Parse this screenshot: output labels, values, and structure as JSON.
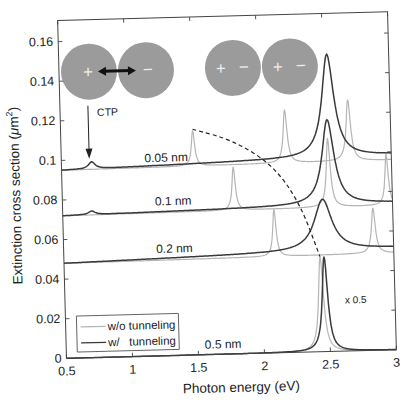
{
  "chart_data": {
    "type": "line",
    "title": "",
    "xlabel": "Photon energy (eV)",
    "ylabel": "Extinction cross section (μm²)",
    "ylabel_parts": {
      "main": "Extinction cross section (",
      "mu": "μ",
      "unit": "m",
      "sup": "2",
      "close": ")"
    },
    "xlim": [
      0.5,
      3
    ],
    "ylim": [
      0,
      0.17
    ],
    "xticks": [
      0.5,
      1,
      1.5,
      2,
      2.5,
      3
    ],
    "xtick_labels": [
      "0.5",
      "1",
      "1.5",
      "2",
      "2.5",
      "3"
    ],
    "yticks": [
      0,
      0.02,
      0.04,
      0.06,
      0.08,
      0.1,
      0.12,
      0.14,
      0.16
    ],
    "ytick_labels": [
      "0",
      "0.02",
      "0.04",
      "0.06",
      "0.08",
      "0.1",
      "0.12",
      "0.14",
      "0.16"
    ],
    "grid": false,
    "legend": {
      "position": "lower left",
      "entries": [
        {
          "label": "w/o tunneling",
          "color": "#b5b5b5"
        },
        {
          "label": "w/   tunneling",
          "color": "#3a3a3a"
        }
      ]
    },
    "series": [
      {
        "name": "0.05 nm w/o tunneling",
        "color": "#b5b5b5",
        "baseline": 0.095,
        "slope": 0.0004,
        "peaks": [
          {
            "x": 1.5,
            "height": 0.018,
            "width": 0.03
          },
          {
            "x": 2.2,
            "height": 0.027,
            "width": 0.035
          },
          {
            "x": 2.68,
            "height": 0.031,
            "width": 0.04
          }
        ]
      },
      {
        "name": "0.05 nm w/ tunneling",
        "color": "#3a3a3a",
        "baseline": 0.095,
        "slope": 0.0015,
        "peaks": [
          {
            "x": 0.73,
            "height": 0.0035,
            "width": 0.06
          },
          {
            "x": 2.53,
            "height": 0.052,
            "width": 0.11
          }
        ]
      },
      {
        "name": "0.1 nm w/o tunneling",
        "color": "#b5b5b5",
        "baseline": 0.072,
        "slope": 0.0004,
        "peaks": [
          {
            "x": 1.8,
            "height": 0.022,
            "width": 0.03
          },
          {
            "x": 2.52,
            "height": 0.035,
            "width": 0.035
          },
          {
            "x": 2.96,
            "height": 0.026,
            "width": 0.03
          }
        ]
      },
      {
        "name": "0.1 nm w/ tunneling",
        "color": "#3a3a3a",
        "baseline": 0.072,
        "slope": 0.001,
        "peaks": [
          {
            "x": 0.72,
            "height": 0.0018,
            "width": 0.06
          },
          {
            "x": 2.52,
            "height": 0.043,
            "width": 0.11
          }
        ]
      },
      {
        "name": "0.2 nm w/o tunneling",
        "color": "#b5b5b5",
        "baseline": 0.048,
        "slope": 0.0004,
        "peaks": [
          {
            "x": 2.1,
            "height": 0.024,
            "width": 0.03
          },
          {
            "x": 2.85,
            "height": 0.023,
            "width": 0.035
          }
        ]
      },
      {
        "name": "0.2 nm w/ tunneling",
        "color": "#3a3a3a",
        "baseline": 0.048,
        "slope": 0.0015,
        "peaks": [
          {
            "x": 2.47,
            "height": 0.026,
            "width": 0.16
          }
        ]
      },
      {
        "name": "0.5 nm w/o tunneling (x0.5)",
        "color": "#b5b5b5",
        "baseline": 0.0,
        "slope": 0.0,
        "peaks": [
          {
            "x": 2.44,
            "height": 0.048,
            "width": 0.045
          }
        ]
      },
      {
        "name": "0.5 nm w/ tunneling (x0.5)",
        "color": "#3a3a3a",
        "baseline": 0.0,
        "slope": 0.0,
        "peaks": [
          {
            "x": 2.47,
            "height": 0.048,
            "width": 0.05
          }
        ]
      }
    ],
    "dashed_trend": {
      "color": "#222222",
      "points": [
        [
          1.5,
          0.114
        ],
        [
          1.8,
          0.108
        ],
        [
          2.1,
          0.095
        ],
        [
          2.3,
          0.075
        ],
        [
          2.44,
          0.048
        ]
      ]
    },
    "annotations": [
      {
        "text": "0.05 nm",
        "x": 1.13,
        "y": 0.098
      },
      {
        "text": "0.1 nm",
        "x": 1.2,
        "y": 0.076
      },
      {
        "text": "0.2 nm",
        "x": 1.2,
        "y": 0.052
      },
      {
        "text": "0.5 nm",
        "x": 1.55,
        "y": 0.003
      },
      {
        "text": "x 0.5",
        "x": 2.62,
        "y": 0.024
      },
      {
        "text": "CTP",
        "x": 0.78,
        "y": 0.122
      }
    ],
    "insets": [
      {
        "name": "charge-transfer-dimer",
        "labels": [
          "+",
          "−"
        ],
        "arrow": "double"
      },
      {
        "name": "bonding-dipole-dimer",
        "labels": [
          "+",
          "−",
          "+",
          "−"
        ]
      }
    ]
  }
}
